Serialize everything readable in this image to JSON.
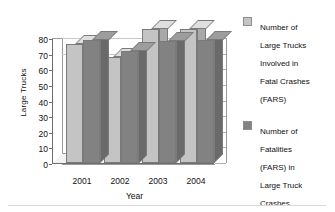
{
  "chart_data": {
    "type": "bar",
    "title": "",
    "xlabel": "Year",
    "ylabel": "Large Trucks",
    "categories": [
      "2001",
      "2002",
      "2003",
      "2004"
    ],
    "series": [
      {
        "name": "Number of Large Trucks Involved in Fatal Crashes (FARS)",
        "color": "#c4c4c4",
        "values": [
          76,
          68,
          86,
          86
        ]
      },
      {
        "name": "Number of Fatalities (FARS) in Large Truck Crashes",
        "color": "#828282",
        "values": [
          79,
          72,
          78,
          79
        ]
      }
    ],
    "ylim": [
      0,
      80
    ],
    "ytick_values": [
      0,
      10,
      20,
      30,
      40,
      50,
      60,
      70,
      80
    ],
    "yticks": [
      "0",
      "10",
      "20",
      "30",
      "40",
      "50",
      "60",
      "70",
      "80"
    ],
    "grid": true,
    "legend_position": "right",
    "style": "3d-clustered-column"
  },
  "axes": {
    "y_title": "Large Trucks",
    "x_title": "Year"
  },
  "legend": {
    "items": [
      {
        "label": "Number of\nLarge Trucks\nInvolved in\nFatal Crashes\n(FARS)",
        "color": "#c4c4c4"
      },
      {
        "label": "Number of\nFatalities\n(FARS) in\nLarge Truck\nCrashes",
        "color": "#828282"
      }
    ]
  }
}
